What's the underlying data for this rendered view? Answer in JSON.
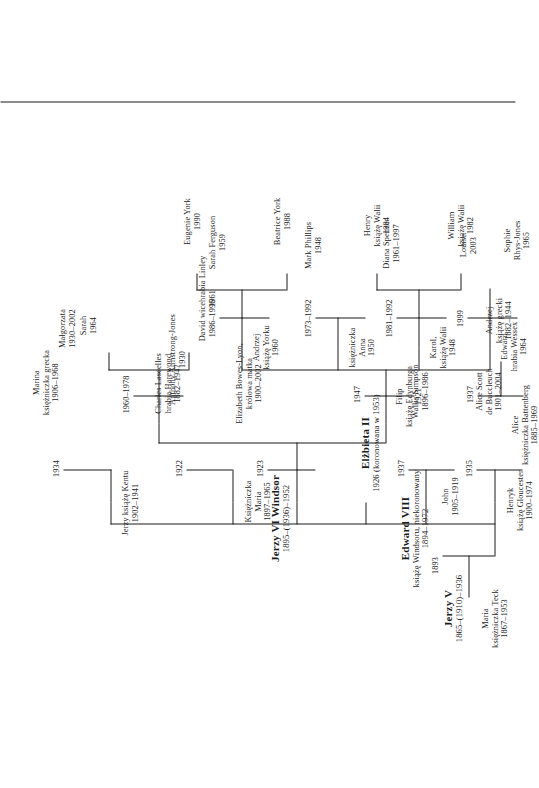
{
  "document": {
    "kind": "family-tree",
    "title": "Drzewo genealogiczne brytyjskiej rodziny królewskiej",
    "language": "pl",
    "orientation": "rotated-90",
    "line_color": "#1b1b1b",
    "background_color": "#ffffff"
  },
  "people": {
    "maria_teck": {
      "name": "Maria",
      "title": "księżniczka Teck",
      "dates": "1867–1953"
    },
    "jerzy_v": {
      "name": "Jerzy V",
      "title": "",
      "dates": "1865–(1910)–1936"
    },
    "henryk_gloucester": {
      "name": "Henryk",
      "title": "książę Gloucester",
      "dates": "1900–1974"
    },
    "alice_scott": {
      "name": "Alice Scott",
      "title": "de Buccleuch",
      "dates": "1901–2004"
    },
    "john": {
      "name": "John",
      "title": "",
      "dates": "1905–1919"
    },
    "edward_viii": {
      "name": "Edward VIII",
      "title": "książę Windsoru, niekoronowany",
      "dates": "1894–1972"
    },
    "wallis_simpson": {
      "name": "Wallis Simpson",
      "title": "",
      "dates": "1896–1986"
    },
    "jerzy_kent": {
      "name": "Jerzy książę Kentu",
      "title": "",
      "dates": "1902–1941"
    },
    "marina_grecka": {
      "name": "Marina",
      "title": "księżniczka grecka",
      "dates": "1906–1968"
    },
    "ksiezniczka_maria": {
      "name": "Księżniczka",
      "title": "Maria",
      "dates": "1897–1965"
    },
    "charles_lascelles": {
      "name": "Charles Lascelles",
      "title": "hrabia Harewood",
      "dates": "1882–1947"
    },
    "jerzy_vi": {
      "name": "Jerzy VI Windsor",
      "title": "",
      "dates": "1895–(1936)–1952"
    },
    "elizabeth_bowes_lyon": {
      "name": "Elizabeth Bowes-Lyon,",
      "title": "królowa matka",
      "dates": "1900–2002"
    },
    "elzbieta_ii": {
      "name": "Elżbieta II",
      "title": "",
      "dates": "1926 (koronowana w 1953)"
    },
    "filip_edynburg": {
      "name": "Filip",
      "title": "książę Edynburga",
      "dates": "1921"
    },
    "alice_battenberg": {
      "name": "Alice",
      "title": "księżniczka Battenberg",
      "dates": "1885–1969"
    },
    "andrzej_grecki": {
      "name": "Andrzej",
      "title": "książę grecki",
      "dates": "1882–1944"
    },
    "malgorzata": {
      "name": "Małgorzata",
      "title": "",
      "dates": "1930–2002"
    },
    "anthony_armstrong_jones": {
      "name": "Anthony Armstrong-Jones",
      "title": "",
      "dates": "1930"
    },
    "david_linley": {
      "name": "David wicehrabia Linley",
      "title": "",
      "dates": "1961"
    },
    "sarah": {
      "name": "Sarah",
      "title": "",
      "dates": "1964"
    },
    "ksiezniczka_anna": {
      "name": "księżniczka",
      "title": "Anna",
      "dates": "1950"
    },
    "mark_phillips": {
      "name": "Mark Phillips",
      "title": "",
      "dates": "1948"
    },
    "karol_walii": {
      "name": "Karol,",
      "title": "książę Walii",
      "dates": "1948"
    },
    "diana_spencer": {
      "name": "Diana Spencer",
      "title": "",
      "dates": "1961–1997"
    },
    "william_walii": {
      "name": "William",
      "title": "książę Walii",
      "dates": "1982"
    },
    "henry_walii": {
      "name": "Henry",
      "title": "książę Walii",
      "dates": "1984"
    },
    "andrzej_yorku": {
      "name": "Andrzej",
      "title": "książę Yorku",
      "dates": "1960"
    },
    "sarah_ferguson": {
      "name": "Sarah Ferguson",
      "title": "",
      "dates": "1959"
    },
    "beatrice_york": {
      "name": "Beatrice York",
      "title": "",
      "dates": "1988"
    },
    "eugenie_york": {
      "name": "Eugenie York",
      "title": "",
      "dates": "1990"
    },
    "edward_wessex": {
      "name": "Edward",
      "title": "hrabia Wessex",
      "dates": "1964"
    },
    "sophie_rhys_jones": {
      "name": "Sophie",
      "title": "Rhys-Jones",
      "dates": "1965"
    },
    "louise": {
      "name": "Louise",
      "title": "",
      "dates": "2003"
    }
  },
  "marriages": [
    {
      "id": "m_jerzyv_maria",
      "year": "1893"
    },
    {
      "id": "m_henryk_alice",
      "year": "1935"
    },
    {
      "id": "m_edward8_wallis",
      "year": "1937"
    },
    {
      "id": "m_jerzykent_marina",
      "year": "1934"
    },
    {
      "id": "m_maria_lascelles",
      "year": "1922"
    },
    {
      "id": "m_jerzyvi_elizabeth",
      "year": "1923"
    },
    {
      "id": "m_elzbieta_filip",
      "year": "1947"
    },
    {
      "id": "m_alice_andrzej",
      "year": "1937"
    },
    {
      "id": "m_malgorzata_anthony",
      "year": "1960–1978"
    },
    {
      "id": "m_anna_mark",
      "year": "1973–1992"
    },
    {
      "id": "m_karol_diana",
      "year": "1981–1992"
    },
    {
      "id": "m_andrzej_sarah",
      "year": "1986–1996"
    },
    {
      "id": "m_edward_sophie",
      "year": "1999"
    }
  ]
}
